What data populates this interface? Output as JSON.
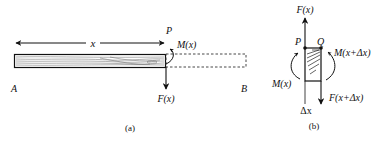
{
  "panel_a": {
    "caption": "(a)",
    "label_A": "A",
    "label_B": "B",
    "label_x": "x",
    "label_P": "P",
    "label_M": "M(x)",
    "label_F": "F(x)"
  },
  "panel_b": {
    "caption": "(b)",
    "label_F_top": "F(x)",
    "label_P": "P",
    "label_Q": "Q",
    "label_M_left": "M(x)",
    "label_M_right": "M(x+Δx)",
    "label_F_bottom": "F(x+Δx)",
    "label_dx": "Δx"
  },
  "colors": {
    "ink": "#111111",
    "dashed": "#333333",
    "grain": "#444444"
  }
}
